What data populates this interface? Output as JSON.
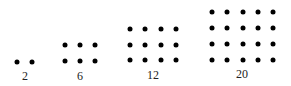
{
  "figure": {
    "groups": [
      {
        "label": "2",
        "rows": 1,
        "cols": 2
      },
      {
        "label": "6",
        "rows": 2,
        "cols": 3
      },
      {
        "label": "12",
        "rows": 3,
        "cols": 4
      },
      {
        "label": "20",
        "rows": 4,
        "cols": 5
      }
    ],
    "dot_color": "#000000"
  }
}
